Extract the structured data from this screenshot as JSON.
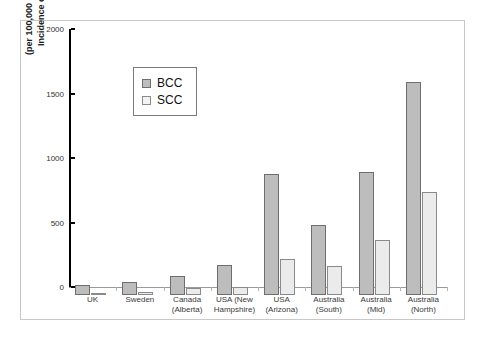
{
  "chart_data": {
    "type": "bar",
    "title": "",
    "xlabel": "",
    "ylabel": "Incidence of BCC/SCC\n(per 100,000 persons-year)",
    "ylabel_line1": "Incidence of BCC/SCC",
    "ylabel_line2": "(per 100,000 persons-year)",
    "ylim": [
      0,
      2000
    ],
    "ytick_values": [
      0,
      500,
      1000,
      1500,
      2000
    ],
    "ytick_labels": [
      "0",
      "500",
      "1000",
      "1500",
      "2000"
    ],
    "grid": false,
    "legend_position": "upper-left-inside",
    "categories": [
      "UK",
      "Sweden",
      "Canada\n(Alberta)",
      "USA (New\nHampshire)",
      "USA\n(Arizona)",
      "Australia\n(South)",
      "Australia\n(Mid)",
      "Australia\n(North)"
    ],
    "series": [
      {
        "name": "BCC",
        "color": "#bdbdbd",
        "border": "#6e6e6e",
        "values": [
          78,
          100,
          148,
          235,
          935,
          545,
          955,
          1655
        ]
      },
      {
        "name": "SCC",
        "color": "#ebebeb",
        "border": "#8a8a8a",
        "values": [
          15,
          25,
          55,
          65,
          280,
          225,
          430,
          795
        ]
      }
    ]
  },
  "legend": {
    "items": [
      {
        "label": "BCC",
        "swatch": "bcc-swatch"
      },
      {
        "label": "SCC",
        "swatch": "scc-swatch"
      }
    ]
  },
  "colors": {
    "bcc_fill": "#bdbdbd",
    "scc_fill": "#ebebeb",
    "axis": "#000000",
    "frame_border": "#c9c9c9",
    "text": "#333333"
  }
}
